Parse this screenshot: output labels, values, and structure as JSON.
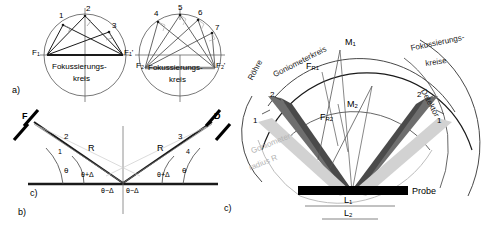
{
  "figure": {
    "panel_labels": {
      "a": "a)",
      "b": "b)",
      "c_left": "c)",
      "c_right": "c)"
    },
    "panel_a": {
      "circle_left": {
        "caption_line1": "Fokussierungs-",
        "caption_line2": "kreis",
        "focus_left": "F",
        "focus_left_sub": "1",
        "focus_right": "F",
        "focus_right_sub": "1",
        "focus_right_prime": "'",
        "points": [
          "1",
          "2",
          "3"
        ]
      },
      "circle_right": {
        "caption_line1": "Fokussierungs-",
        "caption_line2": "kreis",
        "focus_left": "F",
        "focus_left_sub": "2",
        "focus_right": "F",
        "focus_right_sub": "2",
        "focus_right_prime": "'",
        "points": [
          "4",
          "5",
          "6",
          "7"
        ]
      }
    },
    "panel_b": {
      "source": "F",
      "detector": "D",
      "rays": [
        "1",
        "2",
        "3",
        "4"
      ],
      "radius_left": "R",
      "radius_right": "R",
      "angle_theta_left": "θ",
      "angle_theta_plus_left": "θ+Δ",
      "angle_theta_minus_left": "θ−Δ",
      "angle_theta_minus_right": "θ−Δ",
      "angle_theta_plus_right": "θ+Δ",
      "angle_theta_right": "θ"
    },
    "panel_c": {
      "tube": "Röhre",
      "goniometer_circle": "Goniometerkreis",
      "goniometer_radius_line1": "Goniometer-",
      "goniometer_radius_line2": "radius R",
      "detector": "Detektor",
      "focus_circles_line1": "Fokussierungs-",
      "focus_circles_line2": "kreise",
      "midpoint_1": "M",
      "midpoint_1_sub": "1",
      "midpoint_2": "M",
      "midpoint_2_sub": "2",
      "focus_r1": "F",
      "focus_r1_sub": "R1",
      "focus_r2": "F",
      "focus_r2_sub": "R2",
      "sample": "Probe",
      "length_1": "L",
      "length_1_sub": "1",
      "length_2": "L",
      "length_2_sub": "2",
      "points_left": [
        "1",
        "2"
      ],
      "points_right": [
        "2",
        "1"
      ]
    },
    "colors": {
      "line": "#1a1a1a",
      "thin_line": "#555555",
      "gray_light": "#c8c8c8",
      "gray_mid": "#8f8f8f",
      "gray_dark": "#5a5a5a",
      "sample_fill": "#000000",
      "background": "#ffffff"
    }
  }
}
